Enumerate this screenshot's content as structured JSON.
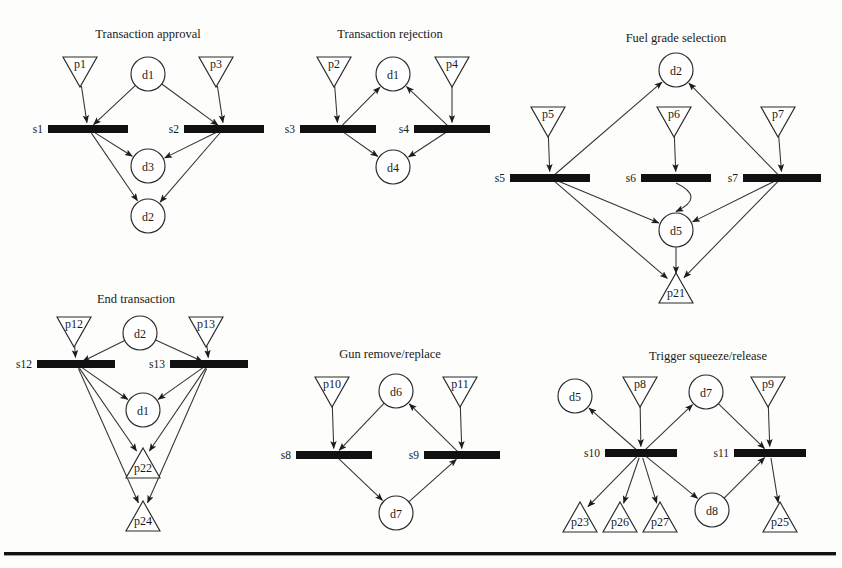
{
  "page": {
    "background": "#fdfdfb",
    "ink": "#1b1b1b",
    "bar_color": "#111111",
    "node_fill": "#ffffff",
    "node_stroke": "#2a2a2a",
    "edge_color": "#333333",
    "figure_kind": "petri-net-diagram-set",
    "divider_rule": true
  },
  "diagrams": [
    {
      "id": "transaction-approval",
      "title": "Transaction approval",
      "title_pos": {
        "x": 148,
        "y": 38
      },
      "places": [
        {
          "label": "p1",
          "shape": "triangle-down",
          "x": 80,
          "y": 72
        },
        {
          "label": "p3",
          "shape": "triangle-down",
          "x": 216,
          "y": 72
        }
      ],
      "conditions": [
        {
          "label": "d1",
          "shape": "circle",
          "x": 148,
          "y": 74
        },
        {
          "label": "d3",
          "shape": "circle",
          "x": 148,
          "y": 166
        },
        {
          "label": "d2",
          "shape": "circle",
          "x": 148,
          "y": 216
        }
      ],
      "transitions": [
        {
          "label": "s1",
          "shape": "bar",
          "x": 88,
          "y": 129,
          "w": 80
        },
        {
          "label": "s2",
          "shape": "bar",
          "x": 224,
          "y": 129,
          "w": 80
        }
      ],
      "edges": [
        {
          "from": "p1",
          "to": "s1"
        },
        {
          "from": "p3",
          "to": "s2"
        },
        {
          "from": "d1",
          "to": "s1"
        },
        {
          "from": "d1",
          "to": "s2"
        },
        {
          "from": "s1",
          "to": "d3"
        },
        {
          "from": "s2",
          "to": "d3"
        },
        {
          "from": "s1",
          "to": "d2"
        },
        {
          "from": "s2",
          "to": "d2"
        }
      ]
    },
    {
      "id": "transaction-rejection",
      "title": "Transaction rejection",
      "title_pos": {
        "x": 390,
        "y": 38
      },
      "places": [
        {
          "label": "p2",
          "shape": "triangle-down",
          "x": 334,
          "y": 72
        },
        {
          "label": "p4",
          "shape": "triangle-down",
          "x": 452,
          "y": 72
        }
      ],
      "conditions": [
        {
          "label": "d1",
          "shape": "circle",
          "x": 393,
          "y": 74
        },
        {
          "label": "d4",
          "shape": "circle",
          "x": 393,
          "y": 167
        }
      ],
      "transitions": [
        {
          "label": "s3",
          "shape": "bar",
          "x": 338,
          "y": 129,
          "w": 76
        },
        {
          "label": "s4",
          "shape": "bar",
          "x": 452,
          "y": 129,
          "w": 76
        }
      ],
      "edges": [
        {
          "from": "p2",
          "to": "s3"
        },
        {
          "from": "p4",
          "to": "s4"
        },
        {
          "from": "s3",
          "to": "d1"
        },
        {
          "from": "s4",
          "to": "d1"
        },
        {
          "from": "s3",
          "to": "d4"
        },
        {
          "from": "s4",
          "to": "d4"
        }
      ]
    },
    {
      "id": "fuel-grade-selection",
      "title": "Fuel grade selection",
      "title_pos": {
        "x": 676,
        "y": 42
      },
      "places": [
        {
          "label": "p5",
          "shape": "triangle-down",
          "x": 548,
          "y": 122
        },
        {
          "label": "p6",
          "shape": "triangle-down",
          "x": 674,
          "y": 122
        },
        {
          "label": "p7",
          "shape": "triangle-down",
          "x": 778,
          "y": 122
        },
        {
          "label": "p21",
          "shape": "triangle-up",
          "x": 676,
          "y": 288
        }
      ],
      "conditions": [
        {
          "label": "d2",
          "shape": "circle",
          "x": 676,
          "y": 70
        },
        {
          "label": "d5",
          "shape": "circle",
          "x": 676,
          "y": 230
        }
      ],
      "transitions": [
        {
          "label": "s5",
          "shape": "bar",
          "x": 550,
          "y": 178,
          "w": 80
        },
        {
          "label": "s6",
          "shape": "bar",
          "x": 676,
          "y": 178,
          "w": 70
        },
        {
          "label": "s7",
          "shape": "bar",
          "x": 782,
          "y": 178,
          "w": 78
        }
      ],
      "edges": [
        {
          "from": "p5",
          "to": "s5"
        },
        {
          "from": "p6",
          "to": "s6"
        },
        {
          "from": "p7",
          "to": "s7"
        },
        {
          "from": "s5",
          "to": "d2"
        },
        {
          "from": "s7",
          "to": "d2"
        },
        {
          "from": "s6",
          "to": "d5",
          "curved": true
        },
        {
          "from": "s5",
          "to": "d5"
        },
        {
          "from": "s7",
          "to": "d5"
        },
        {
          "from": "s5",
          "to": "p21"
        },
        {
          "from": "s7",
          "to": "p21"
        },
        {
          "from": "d5",
          "to": "p21"
        }
      ]
    },
    {
      "id": "end-transaction",
      "title": "End transaction",
      "title_pos": {
        "x": 136,
        "y": 303
      },
      "places": [
        {
          "label": "p12",
          "shape": "triangle-down",
          "x": 74,
          "y": 332
        },
        {
          "label": "p13",
          "shape": "triangle-down",
          "x": 206,
          "y": 332
        },
        {
          "label": "p22",
          "shape": "triangle-up",
          "x": 143,
          "y": 463
        },
        {
          "label": "p24",
          "shape": "triangle-up",
          "x": 143,
          "y": 516
        }
      ],
      "conditions": [
        {
          "label": "d2",
          "shape": "circle",
          "x": 140,
          "y": 333
        },
        {
          "label": "d1",
          "shape": "circle",
          "x": 143,
          "y": 410
        }
      ],
      "transitions": [
        {
          "label": "s12",
          "shape": "bar",
          "x": 76,
          "y": 364,
          "w": 78
        },
        {
          "label": "s13",
          "shape": "bar",
          "x": 209,
          "y": 364,
          "w": 78
        }
      ],
      "edges": [
        {
          "from": "p12",
          "to": "s12"
        },
        {
          "from": "p13",
          "to": "s13"
        },
        {
          "from": "d2",
          "to": "s12"
        },
        {
          "from": "d2",
          "to": "s13"
        },
        {
          "from": "s12",
          "to": "d1"
        },
        {
          "from": "s13",
          "to": "d1"
        },
        {
          "from": "s12",
          "to": "p22"
        },
        {
          "from": "s13",
          "to": "p22"
        },
        {
          "from": "s12",
          "to": "p24"
        },
        {
          "from": "s13",
          "to": "p24"
        }
      ]
    },
    {
      "id": "gun-remove-replace",
      "title": "Gun remove/replace",
      "title_pos": {
        "x": 390,
        "y": 358
      },
      "places": [
        {
          "label": "p10",
          "shape": "triangle-down",
          "x": 332,
          "y": 392
        },
        {
          "label": "p11",
          "shape": "triangle-down",
          "x": 460,
          "y": 392
        }
      ],
      "conditions": [
        {
          "label": "d6",
          "shape": "circle",
          "x": 396,
          "y": 391
        },
        {
          "label": "d7",
          "shape": "circle",
          "x": 396,
          "y": 513
        }
      ],
      "transitions": [
        {
          "label": "s8",
          "shape": "bar",
          "x": 334,
          "y": 455,
          "w": 76
        },
        {
          "label": "s9",
          "shape": "bar",
          "x": 462,
          "y": 455,
          "w": 76
        }
      ],
      "edges": [
        {
          "from": "p10",
          "to": "s8"
        },
        {
          "from": "p11",
          "to": "s9"
        },
        {
          "from": "d6",
          "to": "s8"
        },
        {
          "from": "s9",
          "to": "d6"
        },
        {
          "from": "s8",
          "to": "d7"
        },
        {
          "from": "d7",
          "to": "s9"
        }
      ]
    },
    {
      "id": "trigger-squeeze-release",
      "title": "Trigger squeeze/release",
      "title_pos": {
        "x": 708,
        "y": 360
      },
      "places": [
        {
          "label": "p8",
          "shape": "triangle-down",
          "x": 640,
          "y": 392
        },
        {
          "label": "p9",
          "shape": "triangle-down",
          "x": 768,
          "y": 392
        },
        {
          "label": "p23",
          "shape": "triangle-up",
          "x": 580,
          "y": 517
        },
        {
          "label": "p26",
          "shape": "triangle-up",
          "x": 620,
          "y": 517
        },
        {
          "label": "p27",
          "shape": "triangle-up",
          "x": 660,
          "y": 517
        },
        {
          "label": "p25",
          "shape": "triangle-up",
          "x": 780,
          "y": 517
        }
      ],
      "conditions": [
        {
          "label": "d5",
          "shape": "circle",
          "x": 575,
          "y": 396
        },
        {
          "label": "d7",
          "shape": "circle",
          "x": 706,
          "y": 392
        },
        {
          "label": "d8",
          "shape": "circle",
          "x": 712,
          "y": 510
        }
      ],
      "transitions": [
        {
          "label": "s10",
          "shape": "bar",
          "x": 641,
          "y": 453,
          "w": 72
        },
        {
          "label": "s11",
          "shape": "bar",
          "x": 770,
          "y": 453,
          "w": 72
        }
      ],
      "edges": [
        {
          "from": "p8",
          "to": "s10"
        },
        {
          "from": "p9",
          "to": "s11"
        },
        {
          "from": "s10",
          "to": "d5"
        },
        {
          "from": "s10",
          "to": "d7"
        },
        {
          "from": "d7",
          "to": "s11"
        },
        {
          "from": "s10",
          "to": "p23"
        },
        {
          "from": "s10",
          "to": "p26"
        },
        {
          "from": "s10",
          "to": "p27"
        },
        {
          "from": "s10",
          "to": "d8"
        },
        {
          "from": "d8",
          "to": "s11"
        },
        {
          "from": "s11",
          "to": "p25"
        }
      ]
    }
  ]
}
